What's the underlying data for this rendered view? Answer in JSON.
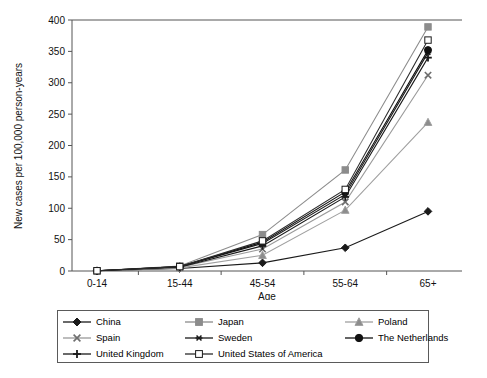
{
  "chart_data": {
    "type": "line",
    "title": "",
    "xlabel": "Age",
    "ylabel": "New cases per 100,000 person-years",
    "categories": [
      "0-14",
      "15-44",
      "45-54",
      "55-64",
      "65+"
    ],
    "ylim": [
      0,
      400
    ],
    "yticks": [
      0,
      50,
      100,
      150,
      200,
      250,
      300,
      350,
      400
    ],
    "grid": false,
    "legend_position": "bottom",
    "series": [
      {
        "name": "China",
        "marker": "diamond",
        "color": "#1a1a1a",
        "fill": "#1a1a1a",
        "values": [
          0.3,
          4,
          13,
          37,
          95
        ]
      },
      {
        "name": "Japan",
        "marker": "square",
        "color": "#8c8c8c",
        "fill": "#8c8c8c",
        "values": [
          0.4,
          8,
          58,
          161,
          389
        ]
      },
      {
        "name": "Poland",
        "marker": "triangle",
        "color": "#a0a0a0",
        "fill": "#8c8c8c",
        "values": [
          0.3,
          5,
          25,
          97,
          237
        ]
      },
      {
        "name": "Spain",
        "marker": "x",
        "color": "#9a9a9a",
        "fill": "#6e6e6e",
        "values": [
          0.3,
          6,
          35,
          110,
          312
        ]
      },
      {
        "name": "Sweden",
        "marker": "asterisk",
        "color": "#1a1a1a",
        "fill": "#1a1a1a",
        "values": [
          0.4,
          7,
          44,
          122,
          348
        ]
      },
      {
        "name": "The Netherlands",
        "marker": "circle",
        "color": "#111111",
        "fill": "#111111",
        "values": [
          0.4,
          7,
          46,
          126,
          352
        ]
      },
      {
        "name": "United Kingdom",
        "marker": "plus",
        "color": "#1a1a1a",
        "fill": "#1a1a1a",
        "values": [
          0.3,
          6,
          40,
          118,
          340
        ]
      },
      {
        "name": "United States of America",
        "marker": "open-square",
        "color": "#2b2b2b",
        "fill": "#ffffff",
        "values": [
          0.4,
          7,
          48,
          130,
          368
        ]
      }
    ]
  },
  "legend": {
    "items": [
      {
        "label": "China"
      },
      {
        "label": "Japan"
      },
      {
        "label": "Poland"
      },
      {
        "label": "Spain"
      },
      {
        "label": "Sweden"
      },
      {
        "label": "The Netherlands"
      },
      {
        "label": "United Kingdom"
      },
      {
        "label": "United States of America"
      }
    ]
  },
  "caption": ""
}
